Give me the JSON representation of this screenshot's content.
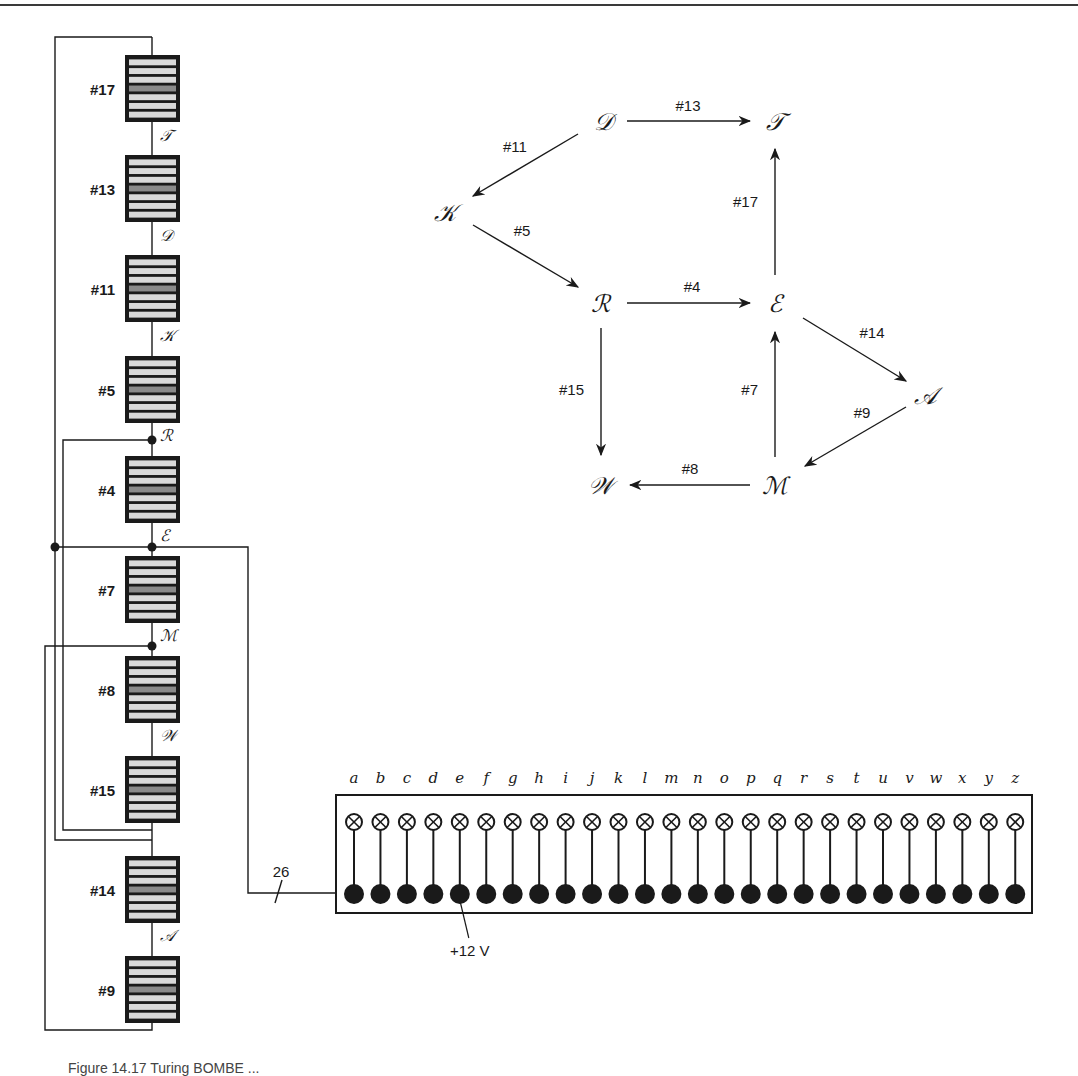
{
  "figure": {
    "caption_partial": "Figure 14.17  Turing BOMBE ..."
  },
  "colors": {
    "line": "#1a1a1a",
    "rotor_stripe_light": "#d9d9d9",
    "rotor_stripe_dark": "#8a8a8a",
    "rotor_border": "#1a1a1a"
  },
  "rotor_stack": {
    "rotors": [
      {
        "label": "#17",
        "top": 55
      },
      {
        "label": "#13",
        "top": 155
      },
      {
        "label": "#11",
        "top": 255
      },
      {
        "label": "#5",
        "top": 356
      },
      {
        "label": "#4",
        "top": 456
      },
      {
        "label": "#7",
        "top": 556
      },
      {
        "label": "#8",
        "top": 656
      },
      {
        "label": "#15",
        "top": 756
      },
      {
        "label": "#14",
        "top": 856
      },
      {
        "label": "#9",
        "top": 956
      }
    ],
    "junction_labels": [
      {
        "letter": "T",
        "y": 135
      },
      {
        "letter": "D",
        "y": 235
      },
      {
        "letter": "K",
        "y": 335
      },
      {
        "letter": "R",
        "y": 435
      },
      {
        "letter": "E",
        "y": 535
      },
      {
        "letter": "M",
        "y": 635
      },
      {
        "letter": "W",
        "y": 735
      },
      {
        "letter": "A",
        "y": 935
      }
    ]
  },
  "menu_graph": {
    "nodes": [
      {
        "id": "D",
        "label": "D",
        "x": 603,
        "y": 121
      },
      {
        "id": "T",
        "label": "T",
        "x": 775,
        "y": 121
      },
      {
        "id": "K",
        "label": "K",
        "x": 445,
        "y": 212
      },
      {
        "id": "R",
        "label": "R",
        "x": 600,
        "y": 303
      },
      {
        "id": "E",
        "label": "E",
        "x": 775,
        "y": 303
      },
      {
        "id": "A",
        "label": "A",
        "x": 925,
        "y": 395
      },
      {
        "id": "W",
        "label": "W",
        "x": 600,
        "y": 485
      },
      {
        "id": "M",
        "label": "M",
        "x": 775,
        "y": 485
      }
    ],
    "edges": [
      {
        "from": "D",
        "to": "T",
        "label": "#13"
      },
      {
        "from": "D",
        "to": "K",
        "label": "#11"
      },
      {
        "from": "K",
        "to": "R",
        "label": "#5"
      },
      {
        "from": "R",
        "to": "E",
        "label": "#4"
      },
      {
        "from": "E",
        "to": "T",
        "label": "#17"
      },
      {
        "from": "E",
        "to": "A",
        "label": "#14"
      },
      {
        "from": "A",
        "to": "M",
        "label": "#9"
      },
      {
        "from": "M",
        "to": "E",
        "label": "#7"
      },
      {
        "from": "M",
        "to": "W",
        "label": "#8"
      },
      {
        "from": "R",
        "to": "W",
        "label": "#15"
      }
    ]
  },
  "lamp_panel": {
    "letters": [
      "a",
      "b",
      "c",
      "d",
      "e",
      "f",
      "g",
      "h",
      "i",
      "j",
      "k",
      "l",
      "m",
      "n",
      "o",
      "p",
      "q",
      "r",
      "s",
      "t",
      "u",
      "v",
      "w",
      "x",
      "y",
      "z"
    ],
    "bus_label": "26",
    "voltage_label": "+12 V",
    "voltage_letter": "e"
  }
}
